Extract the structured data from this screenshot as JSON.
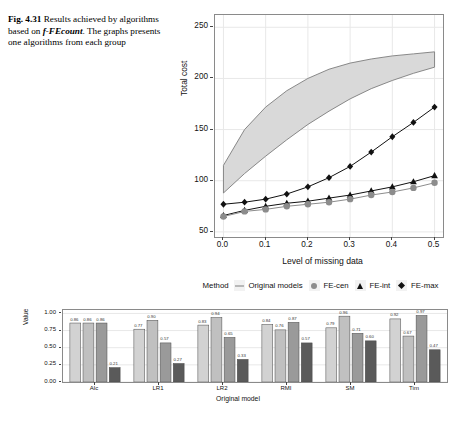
{
  "caption": {
    "fig_number": "Fig. 4.31",
    "line1": "Results achieved",
    "line2": "by algorithms based on",
    "italic_term": "f-FEcount",
    "line3_rest": ". The graphs",
    "line4": "presents one algorithms from",
    "line5": "each group"
  },
  "colors": {
    "band_fill": "#d9d9d9",
    "band_stroke": "#7d7d7d",
    "fe_cen": "#8c8c8c",
    "fe_int": "#111111",
    "fe_max": "#111111",
    "panel_border": "#8a8a8a",
    "grid": "#e8e8e8",
    "bar1": "#d2d2d2",
    "bar2": "#c0c0c0",
    "bar3": "#9a9a9a",
    "bar4": "#5a5a5a"
  },
  "legend": {
    "title": "Method",
    "items": [
      {
        "label": "Original models",
        "key": "line-key-icon"
      },
      {
        "label": "FE-cen",
        "key": "circle-marker-icon"
      },
      {
        "label": "FE-int",
        "key": "triangle-marker-icon"
      },
      {
        "label": "FE-max",
        "key": "diamond-marker-icon"
      }
    ]
  },
  "chart_data": [
    {
      "type": "line",
      "title": "",
      "xlabel": "Level of missing data",
      "ylabel": "Total cost",
      "xlim": [
        -0.02,
        0.52
      ],
      "ylim": [
        45,
        262
      ],
      "xticks": [
        "0.0",
        "0.1",
        "0.2",
        "0.3",
        "0.4",
        "0.5"
      ],
      "xtick_values": [
        0.0,
        0.1,
        0.2,
        0.3,
        0.4,
        0.5
      ],
      "yticks": [
        "50",
        "100",
        "150",
        "200",
        "250"
      ],
      "ytick_values": [
        50,
        100,
        150,
        200,
        250
      ],
      "grid": true,
      "legend_position": "bottom",
      "x": [
        0.0,
        0.05,
        0.1,
        0.15,
        0.2,
        0.25,
        0.3,
        0.35,
        0.4,
        0.45,
        0.5
      ],
      "band": {
        "name": "Original models",
        "upper": [
          115,
          150,
          172,
          188,
          200,
          209,
          215,
          219,
          222,
          224,
          226
        ],
        "lower": [
          88,
          107,
          124,
          140,
          155,
          168,
          180,
          190,
          198,
          205,
          211
        ]
      },
      "series": [
        {
          "name": "FE-max",
          "marker": "diamond",
          "values": [
            77,
            79,
            82,
            87,
            94,
            103,
            114,
            128,
            143,
            157,
            172
          ]
        },
        {
          "name": "FE-int",
          "marker": "triangle",
          "values": [
            66,
            71,
            75,
            78,
            80,
            83,
            86,
            90,
            94,
            99,
            105
          ]
        },
        {
          "name": "FE-cen",
          "marker": "circle",
          "values": [
            65,
            70,
            72,
            75,
            77,
            79,
            82,
            86,
            89,
            93,
            98
          ]
        }
      ]
    },
    {
      "type": "bar",
      "title": "",
      "xlabel": "Original model",
      "ylabel": "Value",
      "ylim": [
        0,
        1.05
      ],
      "yticks": [
        "0.00",
        "0.25",
        "0.50",
        "0.75",
        "1.00"
      ],
      "ytick_values": [
        0.0,
        0.25,
        0.5,
        0.75,
        1.0
      ],
      "grid": true,
      "categories": [
        "Alc",
        "LR1",
        "LR2",
        "RMI",
        "SM",
        "Tim"
      ],
      "series": [
        {
          "name": "bar-1",
          "values": [
            0.86,
            0.77,
            0.83,
            0.84,
            0.79,
            0.92
          ]
        },
        {
          "name": "bar-2",
          "values": [
            0.86,
            0.9,
            0.94,
            0.76,
            0.96,
            0.67
          ]
        },
        {
          "name": "bar-3",
          "values": [
            0.86,
            0.57,
            0.65,
            0.87,
            0.71,
            0.97
          ]
        },
        {
          "name": "bar-4",
          "values": [
            0.21,
            0.27,
            0.33,
            0.57,
            0.6,
            0.47
          ]
        }
      ],
      "labels": [
        [
          "0.86",
          "0.86",
          "0.86",
          "0.21"
        ],
        [
          "0.77",
          "0.90",
          "0.57",
          "0.27"
        ],
        [
          "0.83",
          "0.94",
          "0.65",
          "0.33"
        ],
        [
          "0.84",
          "0.76",
          "0.87",
          "0.57"
        ],
        [
          "0.79",
          "0.96",
          "0.71",
          "0.60"
        ],
        [
          "0.92",
          "0.67",
          "0.97",
          "0.47"
        ]
      ]
    }
  ]
}
